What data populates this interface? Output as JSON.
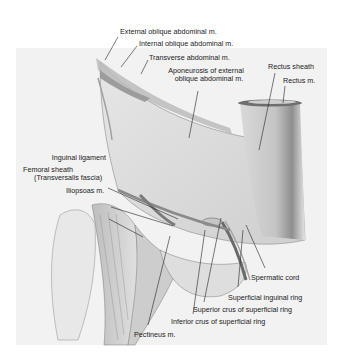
{
  "figure": {
    "colors": {
      "background": "#ffffff",
      "panel": "#f2f2f2",
      "text": "#1a1a1a",
      "leader": "#222222"
    },
    "labels": {
      "external_oblique": "External oblique abdominal m.",
      "internal_oblique": "Internal oblique abdominal m.",
      "transverse": "Transverse abdominal m.",
      "aponeurosis_line1": "Aponeurosis of external",
      "aponeurosis_line2": "oblique abdominal m.",
      "rectus_sheath": "Rectus sheath",
      "rectus_m": "Rectus m.",
      "inguinal_ligament": "Inguinal ligament",
      "femoral_sheath_line1": "Femoral sheath",
      "femoral_sheath_line2": "(Transversalis fascia)",
      "iliopsoas": "Iliopsoas m.",
      "spermatic_cord": "Spermatic cord",
      "superficial_inguinal_ring": "Superficial inguinal ring",
      "superior_crus": "Superior crus of superficial ring",
      "inferior_crus": "Inferior crus of superficial ring",
      "pectineus": "Pectineus m."
    }
  }
}
